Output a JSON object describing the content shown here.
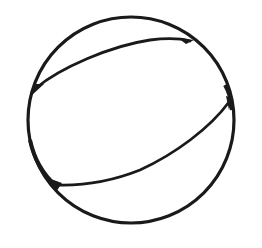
{
  "figure": {
    "subject": "beach ball line drawing",
    "stroke_color": "#1a1a1a",
    "background_color": "#ffffff",
    "outline": {
      "cx": 131,
      "cy": 120,
      "r": 103
    },
    "seams": [
      {
        "name": "upper-seam",
        "from": [
          36,
          88
        ],
        "to": [
          190,
          41
        ]
      },
      {
        "name": "lower-seam",
        "from": [
          229,
          102
        ],
        "to": [
          58,
          185
        ]
      }
    ]
  }
}
